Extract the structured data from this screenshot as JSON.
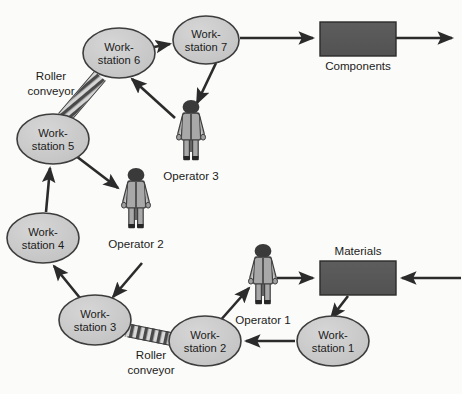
{
  "diagram": {
    "type": "process-flow",
    "canvas": {
      "width": 462,
      "height": 394
    },
    "colors": {
      "background": "#fbfbf9",
      "node_fill": "#c9c9c9",
      "node_stroke": "#3d3d3d",
      "box_fill": "#565656",
      "box_stroke": "#2b2b2b",
      "arrow": "#2b2b2b",
      "operator_body": "#a8a8a8",
      "operator_dark": "#3a3a3a",
      "text": "#1b1b1b",
      "conveyor_light": "#d5d5d5",
      "conveyor_dark": "#4a4a4a"
    },
    "workstations": [
      {
        "id": "ws1",
        "line1": "Work-",
        "line2": "station 1",
        "cx": 333,
        "cy": 341,
        "rx": 36,
        "ry": 25
      },
      {
        "id": "ws2",
        "line1": "Work-",
        "line2": "station 2",
        "cx": 205,
        "cy": 341,
        "rx": 36,
        "ry": 25
      },
      {
        "id": "ws3",
        "line1": "Work-",
        "line2": "station 3",
        "cx": 95,
        "cy": 320,
        "rx": 36,
        "ry": 25
      },
      {
        "id": "ws4",
        "line1": "Work-",
        "line2": "station 4",
        "cx": 43,
        "cy": 238,
        "rx": 36,
        "ry": 25
      },
      {
        "id": "ws5",
        "line1": "Work-",
        "line2": "station 5",
        "cx": 53,
        "cy": 139,
        "rx": 36,
        "ry": 25
      },
      {
        "id": "ws6",
        "line1": "Work-",
        "line2": "station 6",
        "cx": 119,
        "cy": 53,
        "rx": 36,
        "ry": 25
      },
      {
        "id": "ws7",
        "line1": "Work-",
        "line2": "station 7",
        "cx": 206,
        "cy": 40,
        "rx": 33,
        "ry": 24
      }
    ],
    "boxes": [
      {
        "id": "components",
        "label": "Components",
        "x": 320,
        "y": 22,
        "width": 76,
        "height": 34,
        "label_position": "below"
      },
      {
        "id": "materials",
        "label": "Materials",
        "x": 320,
        "y": 261,
        "width": 76,
        "height": 34,
        "label_position": "above"
      }
    ],
    "operators": [
      {
        "id": "op1",
        "label": "Operator 1",
        "x": 249,
        "y": 244,
        "label_x": 255,
        "label_y": 331
      },
      {
        "id": "op2",
        "label": "Operator 2",
        "x": 122,
        "y": 168,
        "label_x": 128,
        "label_y": 255
      },
      {
        "id": "op3",
        "label": "Operator 3",
        "x": 177,
        "y": 100,
        "label_x": 183,
        "label_y": 187
      }
    ],
    "conveyors": [
      {
        "id": "conveyor-top",
        "label_line1": "Roller",
        "label_line2": "conveyor",
        "x1": 98,
        "y1": 77,
        "x2": 66,
        "y2": 116,
        "label_x": 51,
        "label_y": 80
      },
      {
        "id": "conveyor-bottom",
        "label_line1": "Roller",
        "label_line2": "conveyor",
        "x1": 129,
        "y1": 331,
        "x2": 172,
        "y2": 340,
        "label_x": 151,
        "label_y": 357
      }
    ],
    "arrows": [
      {
        "id": "materials-to-ws1",
        "from": "materials",
        "to": "ws1"
      },
      {
        "id": "ws1-to-ws2",
        "from": "ws1",
        "to": "ws2"
      },
      {
        "id": "ws2-to-operator1",
        "from": "ws2",
        "to": "op1"
      },
      {
        "id": "operator1-to-materials",
        "from": "op1",
        "to": "materials"
      },
      {
        "id": "external-to-materials",
        "from": "external-right",
        "to": "materials"
      },
      {
        "id": "ws3-to-ws4",
        "from": "ws3",
        "to": "ws4"
      },
      {
        "id": "operator2-to-ws3",
        "from": "op2",
        "to": "ws3"
      },
      {
        "id": "ws4-to-ws5",
        "from": "ws4",
        "to": "ws5"
      },
      {
        "id": "ws5-to-operator2",
        "from": "ws5",
        "to": "op2"
      },
      {
        "id": "operator3-to-ws6",
        "from": "op3",
        "to": "ws6"
      },
      {
        "id": "ws6-to-ws7",
        "from": "ws6",
        "to": "ws7"
      },
      {
        "id": "ws7-to-operator3",
        "from": "ws7",
        "to": "op3"
      },
      {
        "id": "ws7-to-components",
        "from": "ws7",
        "to": "components"
      },
      {
        "id": "components-to-external",
        "from": "components",
        "to": "external-right"
      }
    ]
  }
}
